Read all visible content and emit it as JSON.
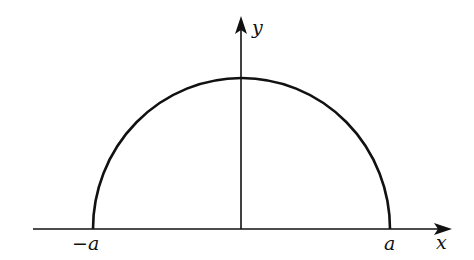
{
  "diagram": {
    "type": "semicircle-on-axes",
    "axes": {
      "x_label": "x",
      "y_label": "y"
    },
    "points": {
      "left_label": "−a",
      "right_label": "a"
    },
    "colors": {
      "stroke": "#111111",
      "background": "#ffffff"
    }
  }
}
